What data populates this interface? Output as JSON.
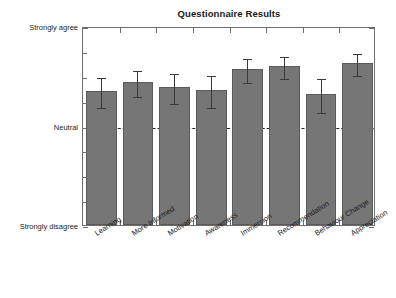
{
  "chart_data": {
    "type": "bar",
    "title": "Questionnaire Results",
    "xlabel": "",
    "ylabel": "",
    "categories": [
      "Learning",
      "More Informed",
      "Motivation",
      "Awareness",
      "Immersion",
      "Recommendation",
      "Behaviour Change",
      "Appreciation"
    ],
    "values": [
      3.7,
      3.88,
      3.78,
      3.72,
      4.14,
      4.2,
      3.64,
      4.26
    ],
    "errors": [
      0.3,
      0.26,
      0.3,
      0.32,
      0.24,
      0.22,
      0.34,
      0.22
    ],
    "ylim": [
      1,
      5
    ],
    "ytick_values": [
      5,
      3,
      1
    ],
    "ytick_labels": [
      "Strongly agree",
      "Neutral",
      "Strongly disagree"
    ],
    "reference_line": {
      "value": 3,
      "label": "Neutral",
      "style": "dashed"
    },
    "grid": false,
    "legend": null,
    "bar_color": "#767676",
    "bar_edge_color": "#5a5a5a",
    "error_bar_color": "#3a3a3a",
    "axis_color": "#6e6e6e",
    "background_color": "#ffffff"
  }
}
